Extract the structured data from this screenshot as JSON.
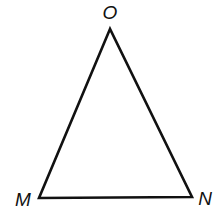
{
  "diagram": {
    "type": "triangle",
    "stroke_color": "#111111",
    "background": "#ffffff",
    "vertices": [
      {
        "label": "O",
        "x": 110,
        "y": 29
      },
      {
        "label": "M",
        "x": 39,
        "y": 198
      },
      {
        "label": "N",
        "x": 192,
        "y": 197
      }
    ],
    "labels": {
      "top": "O",
      "bottom_left": "M",
      "bottom_right": "N"
    }
  }
}
